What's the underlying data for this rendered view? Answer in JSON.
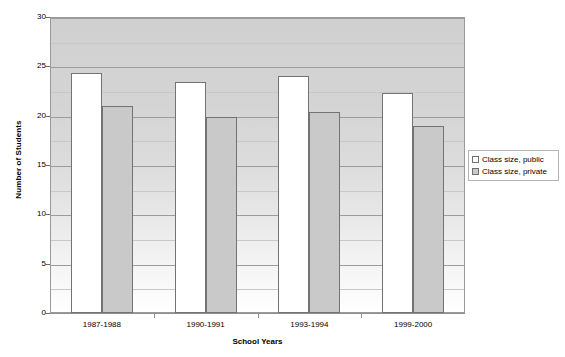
{
  "chart_data": {
    "type": "bar",
    "title": "",
    "xlabel": "School Years",
    "ylabel": "Number of Students",
    "categories": [
      "1987-1988",
      "1990-1991",
      "1993-1994",
      "1999-2000"
    ],
    "series": [
      {
        "name": "Class size, public",
        "values": [
          24.3,
          23.4,
          24.0,
          22.3
        ],
        "color": "#ffffff"
      },
      {
        "name": "Class size, private",
        "values": [
          21.0,
          19.9,
          20.4,
          19.0
        ],
        "color": "#c9c9c9"
      }
    ],
    "ylim": [
      0,
      30
    ],
    "ytick_labels": [
      "0",
      "5",
      "10",
      "15",
      "20",
      "25",
      "30"
    ],
    "ytick_values": [
      0,
      5,
      10,
      15,
      20,
      25,
      30
    ],
    "grid": true,
    "legend_position": "right"
  },
  "legend": {
    "entries": [
      {
        "label": "Class size, public"
      },
      {
        "label": "Class size, private"
      }
    ]
  },
  "axes": {
    "y_title": "Number of Students",
    "x_title": "School Years"
  }
}
